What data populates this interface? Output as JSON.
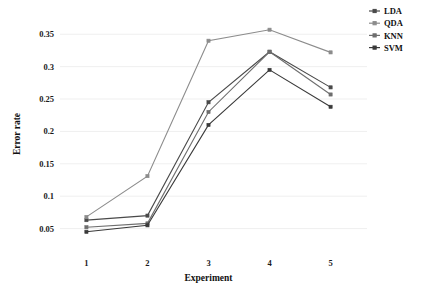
{
  "chart_data": {
    "type": "line",
    "title": "",
    "xlabel": "Experiment",
    "ylabel": "Error rate",
    "categories": [
      "1",
      "2",
      "3",
      "4",
      "5"
    ],
    "x": [
      1,
      2,
      3,
      4,
      5
    ],
    "xlim": [
      0.6,
      5.4
    ],
    "ylim": [
      0.02,
      0.372
    ],
    "grid": true,
    "grid_axis": "y",
    "legend_position": "top-right",
    "yticks": [
      0.05,
      0.1,
      0.15,
      0.2,
      0.25,
      0.3,
      0.35
    ],
    "ytick_labels": [
      "0.05",
      "0.1",
      "0.15",
      "0.2",
      "0.25",
      "0.3",
      "0.35"
    ],
    "xticks": [
      1,
      2,
      3,
      4,
      5
    ],
    "xtick_labels": [
      "1",
      "2",
      "3",
      "4",
      "5"
    ],
    "series": [
      {
        "name": "LDA",
        "color": "#4a4a4a",
        "marker": "square",
        "values": [
          0.063,
          0.07,
          0.245,
          0.323,
          0.268
        ]
      },
      {
        "name": "QDA",
        "color": "#8c8c8c",
        "marker": "square",
        "values": [
          0.068,
          0.131,
          0.34,
          0.357,
          0.322
        ]
      },
      {
        "name": "KNN",
        "color": "#6e6e6e",
        "marker": "square",
        "values": [
          0.052,
          0.058,
          0.23,
          0.323,
          0.257
        ]
      },
      {
        "name": "SVM",
        "color": "#3a3a3a",
        "marker": "square",
        "values": [
          0.045,
          0.055,
          0.21,
          0.295,
          0.238
        ]
      }
    ]
  },
  "legend": {
    "items": [
      {
        "label": "LDA"
      },
      {
        "label": "QDA"
      },
      {
        "label": "KNN"
      },
      {
        "label": "SVM"
      }
    ]
  },
  "axes": {
    "y_title": "Error rate",
    "x_title": "Experiment"
  },
  "colors": {
    "background": "#ffffff",
    "grid": "#e8e8e8",
    "text": "#111111"
  }
}
